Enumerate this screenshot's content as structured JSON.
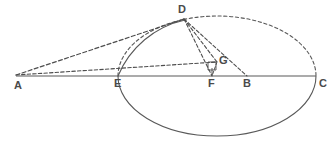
{
  "figure": {
    "kind": "geometry-diagram",
    "width": 334,
    "height": 144,
    "background_color": "#ffffff",
    "stroke_color": "#595959",
    "label_color": "#4a4a4a",
    "labels": [
      {
        "id": "A",
        "text": "A",
        "x": 14,
        "y": 80
      },
      {
        "id": "E",
        "text": "E",
        "x": 114,
        "y": 78
      },
      {
        "id": "F",
        "text": "F",
        "x": 208,
        "y": 78
      },
      {
        "id": "B",
        "text": "B",
        "x": 243,
        "y": 78
      },
      {
        "id": "C",
        "text": "C",
        "x": 319,
        "y": 78
      },
      {
        "id": "D",
        "text": "D",
        "x": 178,
        "y": 4
      },
      {
        "id": "G",
        "text": "G",
        "x": 219,
        "y": 55
      }
    ],
    "points": {
      "A": {
        "x": 16,
        "y": 76
      },
      "E": {
        "x": 118,
        "y": 76
      },
      "F": {
        "x": 212,
        "y": 76
      },
      "B": {
        "x": 247,
        "y": 76
      },
      "C": {
        "x": 316,
        "y": 76
      },
      "D": {
        "x": 184,
        "y": 19
      },
      "G": {
        "x": 217,
        "y": 62
      }
    },
    "ellipse": {
      "cx": 217,
      "cy": 76,
      "rx": 99,
      "ry": 60,
      "upper_half_style": "dashed",
      "lower_half_style": "solid"
    },
    "circle_arc": {
      "cx": 212,
      "cy": 76,
      "r": 94,
      "style": "solid",
      "from_point": "E",
      "to_point": "D"
    },
    "segments": [
      {
        "id": "AC",
        "from": "A",
        "to": "C",
        "style": "solid",
        "name": "axis-line-AC"
      },
      {
        "id": "AD",
        "from": "A",
        "to": "D",
        "style": "dashed",
        "name": "line-AD"
      },
      {
        "id": "AG",
        "from": "A",
        "to": "G",
        "style": "dashed",
        "name": "line-AG"
      },
      {
        "id": "DF",
        "from": "D",
        "to": "F",
        "style": "dashed",
        "name": "line-DF"
      },
      {
        "id": "DG",
        "from": "D",
        "to": "G",
        "style": "dashed",
        "name": "line-DG"
      },
      {
        "id": "DB",
        "from": "D",
        "to": "B",
        "style": "dashed",
        "name": "line-DB"
      },
      {
        "id": "GF",
        "from": "G",
        "to": "F",
        "style": "dashed",
        "name": "line-GF"
      }
    ],
    "right_angle_marker": {
      "at": "G",
      "x": 208,
      "y": 62,
      "size": 8
    }
  }
}
